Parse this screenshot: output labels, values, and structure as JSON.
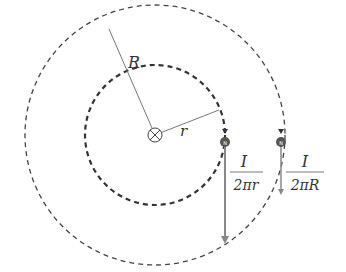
{
  "diagram": {
    "center": {
      "x": 155,
      "y": 135,
      "symbol": "current-into-page"
    },
    "inner_circle": {
      "radius": 70,
      "label": "r",
      "style": "dashed-bold"
    },
    "outer_circle": {
      "radius": 130,
      "label": "R",
      "style": "dashed-thin"
    },
    "labels": {
      "outer_radius": "R",
      "inner_radius": "r",
      "inner_field_numerator": "I",
      "inner_field_denominator": "2πr",
      "outer_field_numerator": "I",
      "outer_field_denominator": "2πR",
      "compass_inner": "N",
      "compass_outer": "N"
    },
    "vectors": [
      {
        "name": "inner-field-vector",
        "x": 225,
        "y_start": 145,
        "y_end": 243,
        "magnitude": "I/2πr"
      },
      {
        "name": "outer-field-vector",
        "x": 281,
        "y_start": 145,
        "y_end": 195,
        "magnitude": "I/2πR"
      }
    ],
    "colors": {
      "line": "#555555",
      "vector": "#888888",
      "compass": "#555555"
    }
  }
}
